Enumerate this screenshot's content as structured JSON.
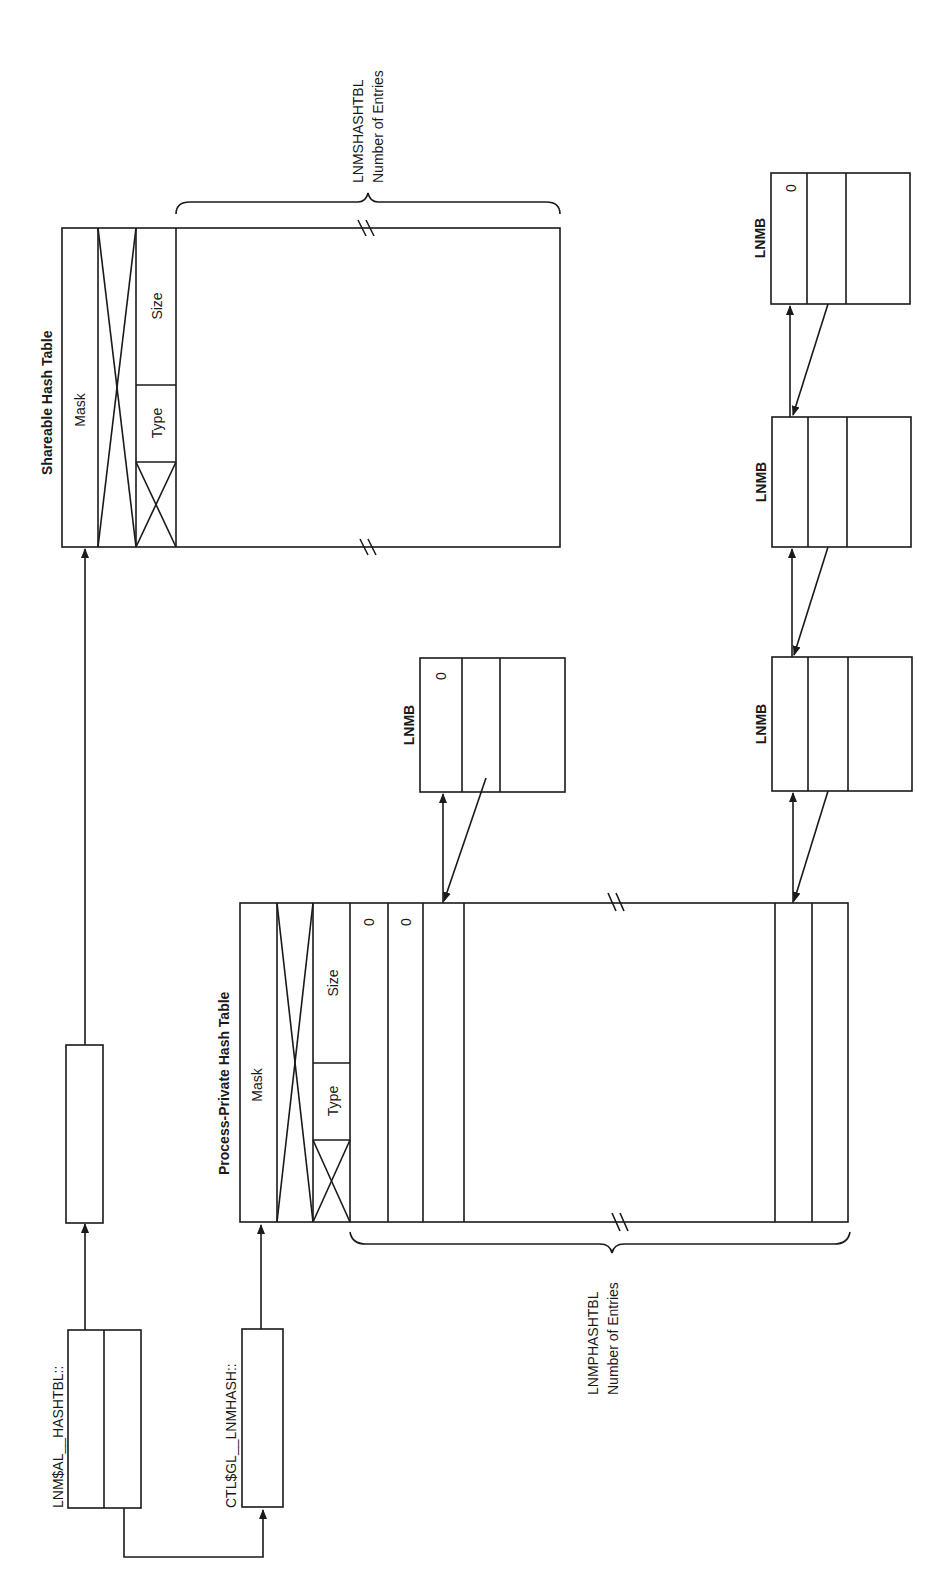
{
  "colors": {
    "background": "#ffffff",
    "ink": "#1a1a1a"
  },
  "pointers": {
    "lnm_al_hashtbl": {
      "label": "LNM$AL__HASHTBL::"
    },
    "ctl_gl_lnmhash": {
      "label": "CTL$GL__LNMHASH::"
    }
  },
  "shareable_table": {
    "title": "Shareable Hash Table",
    "mask_label": "Mask",
    "type_label": "Type",
    "size_label": "Size",
    "entries_label_line1": "LNMSHASHTBL",
    "entries_label_line2": "Number of Entries"
  },
  "process_table": {
    "title": "Process-Private Hash Table",
    "mask_label": "Mask",
    "type_label": "Type",
    "size_label": "Size",
    "slot_values": [
      "0",
      "0"
    ],
    "entries_label_line1": "LNMPHASHTBL",
    "entries_label_line2": "Number of Entries"
  },
  "lnmb_blocks": [
    {
      "label": "LNMB",
      "value": "0",
      "position": "process-chain"
    },
    {
      "label": "LNMB",
      "value": "",
      "position": "chain-1"
    },
    {
      "label": "LNMB",
      "value": "",
      "position": "chain-2"
    },
    {
      "label": "LNMB",
      "value": "0",
      "position": "chain-3"
    }
  ]
}
